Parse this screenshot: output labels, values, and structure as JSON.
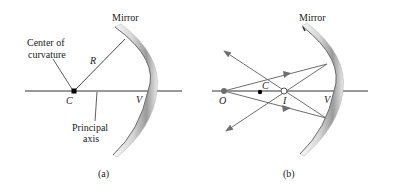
{
  "panels": [
    {
      "id": "a",
      "caption": "(a)",
      "mirror_label": "Mirror",
      "center_label_line1": "Center of",
      "center_label_line2": "curvature",
      "radius_label": "R",
      "center_point_label": "C",
      "vertex_label": "V",
      "axis_label_line1": "Principal",
      "axis_label_line2": "axis"
    },
    {
      "id": "b",
      "caption": "(b)",
      "mirror_label": "Mirror",
      "object_label": "O",
      "center_point_label": "C",
      "image_label": "I",
      "vertex_label": "V"
    }
  ],
  "colors": {
    "line": "#333333",
    "ray": "#6e6e6e",
    "mirror_light": "#f2f2f2",
    "mirror_dark": "#8a8a8a"
  }
}
